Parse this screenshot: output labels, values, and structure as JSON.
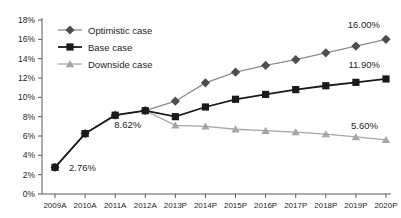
{
  "chart_data": {
    "type": "line",
    "title": "",
    "xlabel": "",
    "ylabel": "",
    "ylim": [
      0,
      18
    ],
    "ytick_labels": [
      "0%",
      "2%",
      "4%",
      "6%",
      "8%",
      "10%",
      "12%",
      "14%",
      "16%",
      "18%"
    ],
    "ytick_values": [
      0,
      2,
      4,
      6,
      8,
      10,
      12,
      14,
      16,
      18
    ],
    "grid": false,
    "legend_position": "top-left",
    "categories": [
      "2009A",
      "2010A",
      "2011A",
      "2012A",
      "2013P",
      "2014P",
      "2015P",
      "2016P",
      "2017P",
      "2018P",
      "2019P",
      "2020P"
    ],
    "series": [
      {
        "name": "Optimistic case",
        "marker": "diamond",
        "color": "#4d4d4d",
        "line_color": "#8c8c8c",
        "values": [
          2.76,
          6.25,
          8.15,
          8.62,
          9.6,
          11.5,
          12.6,
          13.3,
          13.9,
          14.6,
          15.3,
          16.0
        ]
      },
      {
        "name": "Base case",
        "marker": "square",
        "color": "#1a1a1a",
        "line_color": "#1a1a1a",
        "values": [
          2.76,
          6.25,
          8.15,
          8.62,
          8.0,
          9.0,
          9.8,
          10.3,
          10.8,
          11.2,
          11.55,
          11.9
        ]
      },
      {
        "name": "Downside case",
        "marker": "triangle",
        "color": "#a6a6a6",
        "line_color": "#a6a6a6",
        "values": [
          2.76,
          6.25,
          8.15,
          8.62,
          7.1,
          7.0,
          6.7,
          6.55,
          6.4,
          6.2,
          5.9,
          5.6
        ]
      }
    ],
    "annotations": [
      {
        "text": "2.76%",
        "x_index": 0,
        "value": 2.76,
        "dx": 14,
        "dy": 4
      },
      {
        "text": "8.62%",
        "x_index": 3,
        "value": 8.62,
        "dx": -4,
        "dy": 17
      },
      {
        "text": "16.00%",
        "x_index": 11,
        "value": 16.0,
        "dx": -6,
        "dy": -11
      },
      {
        "text": "11.90%",
        "x_index": 11,
        "value": 11.9,
        "dx": -6,
        "dy": -11
      },
      {
        "text": "5.60%",
        "x_index": 11,
        "value": 5.6,
        "dx": -8,
        "dy": -11
      }
    ]
  }
}
